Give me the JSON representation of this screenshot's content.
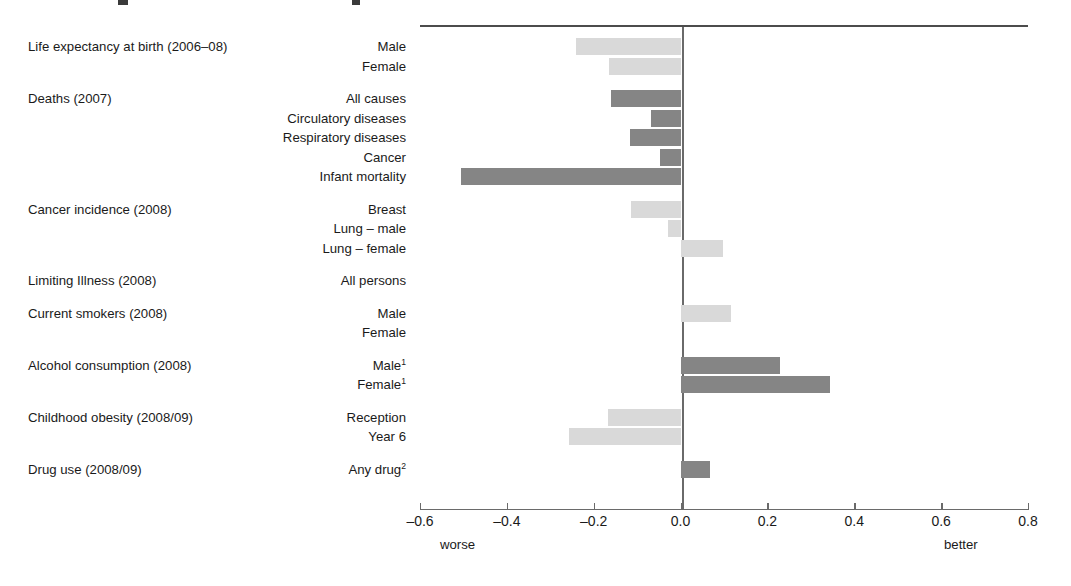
{
  "chart_data": {
    "type": "bar",
    "orientation": "horizontal",
    "title": "",
    "xlabel": "",
    "ylabel": "",
    "xlim": [
      -0.6,
      0.8
    ],
    "xticks": [
      -0.6,
      -0.4,
      -0.2,
      0.0,
      0.2,
      0.4,
      0.6,
      0.8
    ],
    "xtick_labels": [
      "–0.6",
      "–0.4",
      "–0.2",
      "0.0",
      "0.2",
      "0.4",
      "0.6",
      "0.8"
    ],
    "axis_end_labels": {
      "left": "worse",
      "right": "better"
    },
    "grid": false,
    "legend": "none",
    "zero_reference_line": true,
    "colors": {
      "light": "#d9d9d9",
      "dark": "#858585",
      "axis": "#6a6a6a",
      "text": "#1a1a1a"
    },
    "groups": [
      {
        "group_label": "Life expectancy at birth (2006–08)",
        "shade": "light",
        "categories": [
          "Male",
          "Female"
        ],
        "values": [
          -0.24,
          -0.165
        ]
      },
      {
        "group_label": "Deaths (2007)",
        "shade": "dark",
        "categories": [
          "All causes",
          "Circulatory diseases",
          "Respiratory diseases",
          "Cancer",
          "Infant mortality"
        ],
        "values": [
          -0.16,
          -0.068,
          -0.117,
          -0.047,
          -0.505
        ]
      },
      {
        "group_label": "Cancer incidence (2008)",
        "shade": "light",
        "categories": [
          "Breast",
          "Lung – male",
          "Lung – female"
        ],
        "values": [
          -0.113,
          -0.028,
          0.098
        ]
      },
      {
        "group_label": "Limiting Illness (2008)",
        "shade": "light",
        "categories": [
          "All persons"
        ],
        "values": [
          0.0
        ]
      },
      {
        "group_label": "Current smokers (2008)",
        "shade": "light",
        "categories": [
          "Male",
          "Female"
        ],
        "values": [
          0.115,
          0.0
        ]
      },
      {
        "group_label": "Alcohol consumption (2008)",
        "shade": "dark",
        "categories": [
          "Male¹",
          "Female¹"
        ],
        "values": [
          0.23,
          0.345
        ]
      },
      {
        "group_label": "Childhood obesity (2008/09)",
        "shade": "light",
        "categories": [
          "Reception",
          "Year 6"
        ],
        "values": [
          -0.168,
          -0.256
        ]
      },
      {
        "group_label": "Drug use (2008/09)",
        "shade": "dark",
        "categories": [
          "Any drug²"
        ],
        "values": [
          0.068
        ]
      }
    ]
  }
}
